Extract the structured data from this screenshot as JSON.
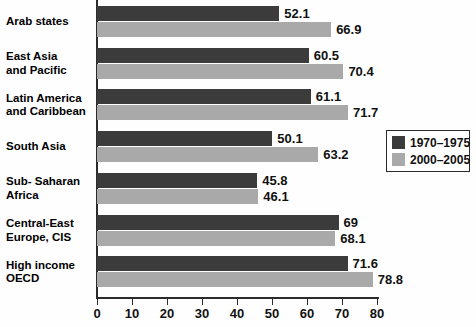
{
  "chart_data": {
    "type": "bar",
    "orientation": "horizontal",
    "title": "",
    "xlabel": "",
    "ylabel": "",
    "xlim": [
      0,
      80
    ],
    "xticks": [
      0,
      10,
      20,
      30,
      40,
      50,
      60,
      70,
      80
    ],
    "grid": false,
    "legend_position": "middle-right",
    "categories": [
      "Arab states",
      "East Asia and Pacific",
      "Latin America and Caribbean",
      "South Asia",
      "Sub- Saharan Africa",
      "Central-East Europe, CIS",
      "High income OECD"
    ],
    "category_lines": [
      [
        "Arab states"
      ],
      [
        "East Asia",
        "and Pacific"
      ],
      [
        "Latin America",
        "and Caribbean"
      ],
      [
        "South Asia"
      ],
      [
        "Sub- Saharan",
        "Africa"
      ],
      [
        "Central-East",
        "Europe, CIS"
      ],
      [
        "High income",
        "OECD"
      ]
    ],
    "series": [
      {
        "name": "1970–1975",
        "color": "#3b3b3b",
        "values": [
          52.1,
          60.5,
          61.1,
          50.1,
          45.8,
          69,
          71.6
        ],
        "value_labels": [
          "52.1",
          "60.5",
          "61.1",
          "50.1",
          "45.8",
          "69",
          "71.6"
        ]
      },
      {
        "name": "2000–2005",
        "color": "#a9a9a9",
        "values": [
          66.9,
          70.4,
          71.7,
          63.2,
          46.1,
          68.1,
          78.8
        ],
        "value_labels": [
          "66.9",
          "70.4",
          "71.7",
          "63.2",
          "46.1",
          "68.1",
          "78.8"
        ]
      }
    ]
  },
  "legend": {
    "entries": [
      {
        "label": "1970–1975",
        "color": "#3b3b3b"
      },
      {
        "label": "2000–2005",
        "color": "#a9a9a9"
      }
    ]
  },
  "axis": {
    "tick_labels": [
      "0",
      "10",
      "20",
      "30",
      "40",
      "50",
      "60",
      "70",
      "80"
    ]
  },
  "colors": {
    "period_a": "#3b3b3b",
    "period_b": "#a9a9a9",
    "axis": "#2b2b2b",
    "text": "#111111",
    "background": "#ffffff"
  }
}
